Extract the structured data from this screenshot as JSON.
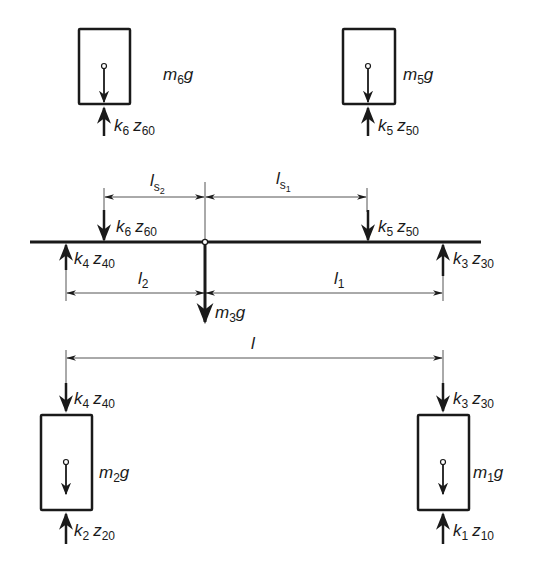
{
  "diagram": {
    "type": "free-body diagram",
    "colors": {
      "ink": "#1a1a1a",
      "thin": "#555555",
      "background": "#ffffff"
    },
    "masses": [
      {
        "id": "m6",
        "label": "m",
        "sub": "6",
        "suffix": "g",
        "force_label": "k",
        "force_k_sub": "6",
        "force_z": "z",
        "force_z_sub": "60"
      },
      {
        "id": "m5",
        "label": "m",
        "sub": "5",
        "suffix": "g",
        "force_label": "k",
        "force_k_sub": "5",
        "force_z": "z",
        "force_z_sub": "50"
      },
      {
        "id": "m2",
        "label": "m",
        "sub": "2",
        "suffix": "g",
        "top_force_k_sub": "4",
        "top_force_z_sub": "40",
        "bottom_force_k_sub": "2",
        "bottom_force_z_sub": "20"
      },
      {
        "id": "m1",
        "label": "m",
        "sub": "1",
        "suffix": "g",
        "top_force_k_sub": "3",
        "top_force_z_sub": "30",
        "bottom_force_k_sub": "1",
        "bottom_force_z_sub": "10"
      }
    ],
    "beam": {
      "weight": {
        "label": "m",
        "sub": "3",
        "suffix": "g"
      },
      "forces": [
        {
          "k": "k",
          "k_sub": "6",
          "z": "z",
          "z_sub": "60",
          "dir": "down"
        },
        {
          "k": "k",
          "k_sub": "5",
          "z": "z",
          "z_sub": "50",
          "dir": "down"
        },
        {
          "k": "k",
          "k_sub": "4",
          "z": "z",
          "z_sub": "40",
          "dir": "up"
        },
        {
          "k": "k",
          "k_sub": "3",
          "z": "z",
          "z_sub": "30",
          "dir": "up"
        }
      ]
    },
    "dimensions": {
      "ls2": {
        "label": "l",
        "sub": "s",
        "subsub": "2"
      },
      "ls1": {
        "label": "l",
        "sub": "s",
        "subsub": "1"
      },
      "l2": {
        "label": "l",
        "sub": "2"
      },
      "l1": {
        "label": "l",
        "sub": "1"
      },
      "l": {
        "label": "l"
      }
    }
  }
}
